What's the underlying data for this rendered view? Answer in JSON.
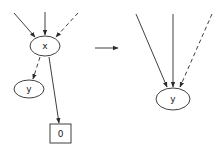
{
  "left_graph": {
    "nodes": {
      "x": {
        "label": "x",
        "shape": "ellipse"
      },
      "y": {
        "label": "y",
        "shape": "ellipse"
      },
      "zero": {
        "label": "0",
        "shape": "box"
      }
    },
    "edges": [
      {
        "from": "external-1",
        "to": "x",
        "style": "solid"
      },
      {
        "from": "external-2",
        "to": "x",
        "style": "solid"
      },
      {
        "from": "external-3",
        "to": "x",
        "style": "dashed"
      },
      {
        "from": "x",
        "to": "y",
        "style": "dashed"
      },
      {
        "from": "x",
        "to": "0",
        "style": "solid"
      }
    ]
  },
  "transform_arrow": {
    "direction": "right"
  },
  "right_graph": {
    "nodes": {
      "y": {
        "label": "y",
        "shape": "ellipse"
      }
    },
    "edges": [
      {
        "from": "external-1",
        "to": "y",
        "style": "solid"
      },
      {
        "from": "external-2",
        "to": "y",
        "style": "solid"
      },
      {
        "from": "external-3",
        "to": "y",
        "style": "dashed"
      }
    ]
  },
  "colors": {
    "line": "#2a2a2a",
    "background": "#ffffff"
  }
}
